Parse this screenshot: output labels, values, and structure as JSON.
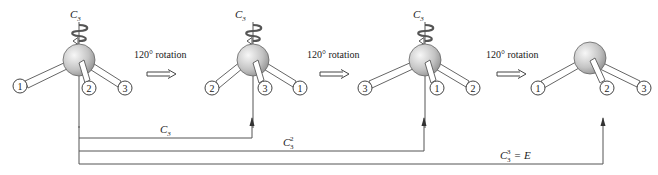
{
  "axis_label": "C",
  "axis_sub": "3",
  "rotation_label": "120° rotation",
  "colors": {
    "line": "#555555",
    "sphere_light": "#f2f2f2",
    "sphere_dark": "#9a9a9a",
    "text": "#222222"
  },
  "molecules": [
    {
      "id": "m1",
      "has_axis_arrow": true,
      "ligands": [
        "1",
        "2",
        "3"
      ]
    },
    {
      "id": "m2",
      "has_axis_arrow": true,
      "ligands": [
        "2",
        "3",
        "1"
      ]
    },
    {
      "id": "m3",
      "has_axis_arrow": true,
      "ligands": [
        "3",
        "1",
        "2"
      ]
    },
    {
      "id": "m4",
      "has_axis_arrow": false,
      "ligands": [
        "1",
        "2",
        "3"
      ]
    }
  ],
  "operations": [
    {
      "base": "C",
      "sub": "3",
      "sup": "",
      "suffix": ""
    },
    {
      "base": "C",
      "sub": "3",
      "sup": "2",
      "suffix": ""
    },
    {
      "base": "C",
      "sub": "3",
      "sup": "3",
      "suffix": " = E"
    }
  ]
}
